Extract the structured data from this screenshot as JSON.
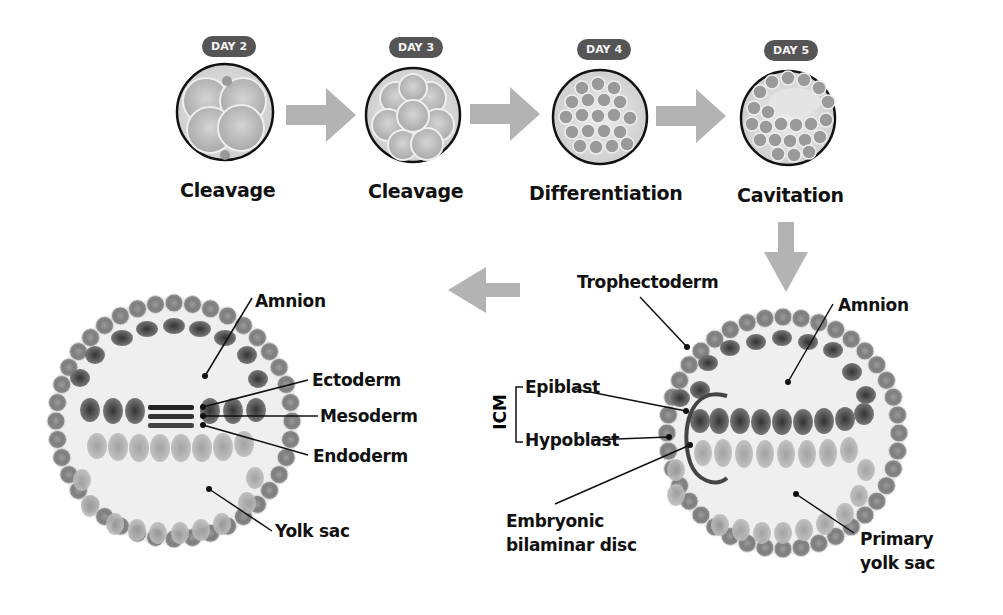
{
  "stages": [
    {
      "day": "DAY 2",
      "label": "Cleavage"
    },
    {
      "day": "DAY 3",
      "label": "Cleavage"
    },
    {
      "day": "DAY 4",
      "label": "Differentiation"
    },
    {
      "day": "DAY 5",
      "label": "Cavitation"
    }
  ],
  "right_embryo": {
    "labels": {
      "trophectoderm": "Trophectoderm",
      "amnion": "Amnion",
      "icm": "ICM",
      "epiblast": "Epiblast",
      "hypoblast": "Hypoblast",
      "disc_line1": "Embryonic",
      "disc_line2": "bilaminar disc",
      "yolk_line1": "Primary",
      "yolk_line2": "yolk sac"
    }
  },
  "left_embryo": {
    "labels": {
      "amnion": "Amnion",
      "ectoderm": "Ectoderm",
      "mesoderm": "Mesoderm",
      "endoderm": "Endoderm",
      "yolk_sac": "Yolk sac"
    }
  },
  "colors": {
    "arrow": "#b3b3b3",
    "pill": "#555555",
    "cell_outer": "#8a8a8a",
    "cell_dark": "#4a4a4a",
    "cell_light": "#a8a8a8",
    "disc_ring": "#444444"
  }
}
